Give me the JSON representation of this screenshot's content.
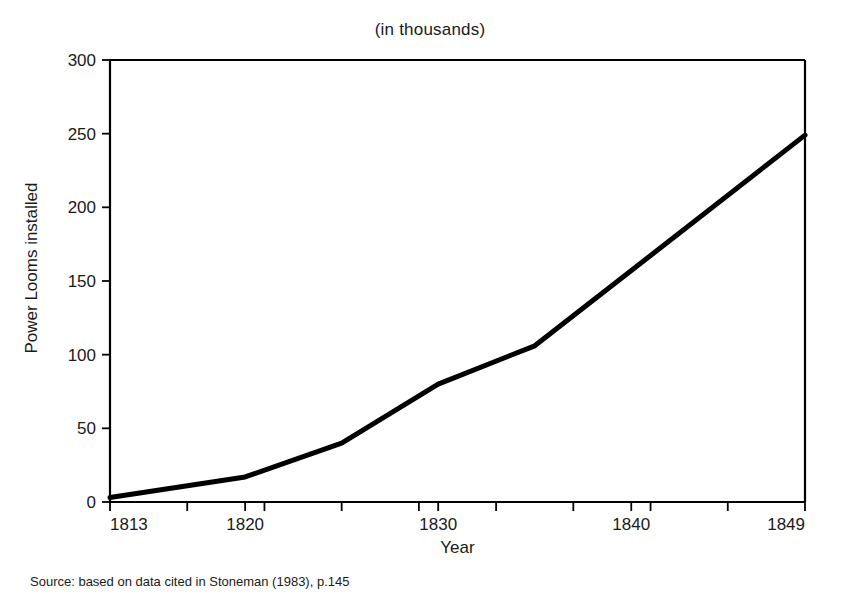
{
  "chart_data": {
    "type": "line",
    "title": "(in thousands)",
    "xlabel": "Year",
    "ylabel": "Power Looms installed",
    "x": [
      1813,
      1820,
      1825,
      1830,
      1835,
      1849
    ],
    "values": [
      3,
      17,
      40,
      80,
      106,
      249
    ],
    "series": [
      {
        "name": "Power Looms installed",
        "values": [
          3,
          17,
          40,
          80,
          106,
          249
        ]
      }
    ],
    "xlim": [
      1813,
      1849
    ],
    "ylim": [
      0,
      300
    ],
    "x_tick_labels": [
      "1813",
      "1820",
      "1830",
      "1840",
      "1849"
    ],
    "x_tick_values": [
      1813,
      1820,
      1830,
      1840,
      1849
    ],
    "y_tick_labels": [
      "0",
      "50",
      "100",
      "150",
      "200",
      "250",
      "300"
    ],
    "y_tick_values": [
      0,
      50,
      100,
      150,
      200,
      250,
      300
    ],
    "grid": false,
    "legend": "none",
    "line_color": "#000000",
    "background_color": "#ffffff"
  },
  "annotations": {
    "source": "Source: based on data cited in Stoneman (1983), p.145"
  }
}
